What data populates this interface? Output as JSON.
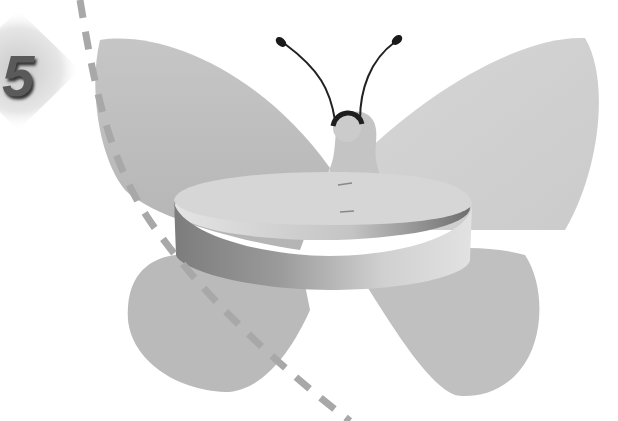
{
  "illustration": {
    "step": {
      "number": "5"
    },
    "subject": "paper butterfly with ring band",
    "colors": {
      "wing": "#bdbdbd",
      "wing_light": "#d3d3d3",
      "ring_top": "#d8d8d8",
      "ring_side_dark": "#8a8a8a",
      "ring_side_light": "#dcdcdc",
      "dashed_line": "#a8a8a8",
      "antenna": "#222222",
      "background": "#ffffff"
    }
  }
}
